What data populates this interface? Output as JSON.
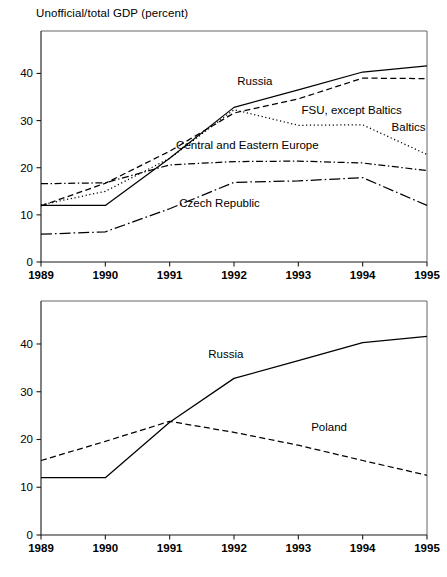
{
  "title": "Unofficial/total GDP (percent)",
  "footer": {
    "partial_caption": ""
  },
  "axis": {
    "y_ticks": [
      0,
      10,
      20,
      30,
      40
    ],
    "x_ticks": [
      "1989",
      "1990",
      "1991",
      "1992",
      "1993",
      "1994",
      "1995"
    ],
    "ylim": [
      0,
      49
    ],
    "xlim": [
      1989,
      1995
    ]
  },
  "chart_data": [
    {
      "type": "line",
      "title": "Unofficial/total GDP (percent)",
      "xlabel": "",
      "ylabel": "Unofficial/total GDP (percent)",
      "ylim": [
        0,
        49
      ],
      "grid": false,
      "legend_position": "inline-annotations",
      "x": [
        1989,
        1990,
        1991,
        1992,
        1993,
        1994,
        1995
      ],
      "series": [
        {
          "name": "Russia",
          "style": "solid",
          "values": [
            12.0,
            12.0,
            22.0,
            32.8,
            36.5,
            40.3,
            41.6
          ],
          "label_x": 1992.05,
          "label_y": 37.6
        },
        {
          "name": "FSU, except Baltics",
          "style": "dashed",
          "values": [
            11.9,
            16.7,
            23.5,
            31.6,
            34.6,
            39.0,
            38.9
          ],
          "label_x": 1993.05,
          "label_y": 31.3
        },
        {
          "name": "Baltics",
          "style": "dotted",
          "values": [
            12.1,
            15.0,
            22.0,
            32.3,
            29.0,
            29.1,
            22.8
          ],
          "label_x": 1994.45,
          "label_y": 27.8
        },
        {
          "name": "Central and Eastern Europe",
          "style": "dashdot",
          "values": [
            16.6,
            16.8,
            20.6,
            21.3,
            21.4,
            21.0,
            19.4
          ],
          "label_x": 1991.1,
          "label_y": 24.0
        },
        {
          "name": "Czech Republic",
          "style": "longdashdot",
          "values": [
            5.9,
            6.4,
            11.3,
            16.9,
            17.2,
            17.9,
            12.0
          ],
          "label_x": 1991.15,
          "label_y": 11.7
        }
      ]
    },
    {
      "type": "line",
      "title": "",
      "xlabel": "",
      "ylabel": "",
      "ylim": [
        0,
        49
      ],
      "grid": false,
      "legend_position": "inline-annotations",
      "x": [
        1989,
        1990,
        1991,
        1992,
        1993,
        1994,
        1995
      ],
      "series": [
        {
          "name": "Russia",
          "style": "solid",
          "values": [
            12.0,
            12.0,
            23.6,
            32.8,
            36.5,
            40.3,
            41.6
          ],
          "label_x": 1991.6,
          "label_y": 37.0
        },
        {
          "name": "Poland",
          "style": "dashed",
          "values": [
            15.6,
            19.6,
            23.8,
            21.5,
            18.8,
            15.6,
            12.5
          ],
          "label_x": 1993.2,
          "label_y": 21.8
        }
      ]
    }
  ]
}
